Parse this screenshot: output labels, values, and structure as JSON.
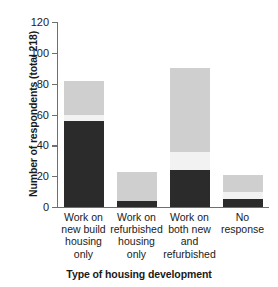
{
  "chart_data": {
    "type": "bar",
    "subtype": "stacked-bar",
    "title": "",
    "xlabel": "Type of housing development",
    "ylabel": "Number of respondents (total 218)",
    "categories": [
      "Work on\nnew build\nhousing\nonly",
      "Work on\nrefurbished\nhousing\nonly",
      "Work on\nboth new\nand\nrefurbished",
      "No\nresponse"
    ],
    "categories_flat": [
      "Work on new build housing only",
      "Work on refurbished housing only",
      "Work on both new and refurbished",
      "No response"
    ],
    "series": [
      {
        "name": "dark-segment",
        "color": "#2b2b2b",
        "values": [
          56,
          4,
          24,
          5
        ]
      },
      {
        "name": "mid-segment",
        "color": "#f2f2f2",
        "values": [
          4,
          0,
          12,
          5
        ]
      },
      {
        "name": "light-segment",
        "color": "#cfcfcf",
        "values": [
          22,
          19,
          54,
          11
        ]
      }
    ],
    "totals": [
      82,
      23,
      90,
      21
    ],
    "ylim": [
      0,
      120
    ],
    "yticks": [
      0,
      20,
      40,
      60,
      80,
      100,
      120
    ],
    "ytick_labels": [
      "0",
      "20",
      "40",
      "60",
      "80",
      "100",
      "120"
    ],
    "grid": false,
    "legend": "none",
    "axis_color": "#6f6f6f"
  }
}
